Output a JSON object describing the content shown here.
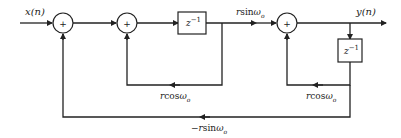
{
  "diagram": {
    "type": "signal-flow block diagram (coupled-form oscillator / resonator)",
    "input_label": "x(n)",
    "output_label": "y(n)",
    "adders": [
      {
        "id": "adder-1",
        "symbol": "+"
      },
      {
        "id": "adder-2",
        "symbol": "+"
      },
      {
        "id": "adder-3",
        "symbol": "+"
      }
    ],
    "delays": [
      {
        "id": "delay-1",
        "label": "z",
        "exponent": "−1"
      },
      {
        "id": "delay-2",
        "label": "z",
        "exponent": "−1"
      }
    ],
    "gains": {
      "forward": {
        "prefix": "r",
        "func": "sin",
        "omega": "ω",
        "sub": "o"
      },
      "feedback_1": {
        "prefix": "r",
        "func": "cos",
        "omega": "ω",
        "sub": "o"
      },
      "feedback_2": {
        "prefix": "r",
        "func": "cos",
        "omega": "ω",
        "sub": "o"
      },
      "outer_feedback": {
        "prefix": "−r",
        "func": "sin",
        "omega": "ω",
        "sub": "o"
      }
    }
  }
}
